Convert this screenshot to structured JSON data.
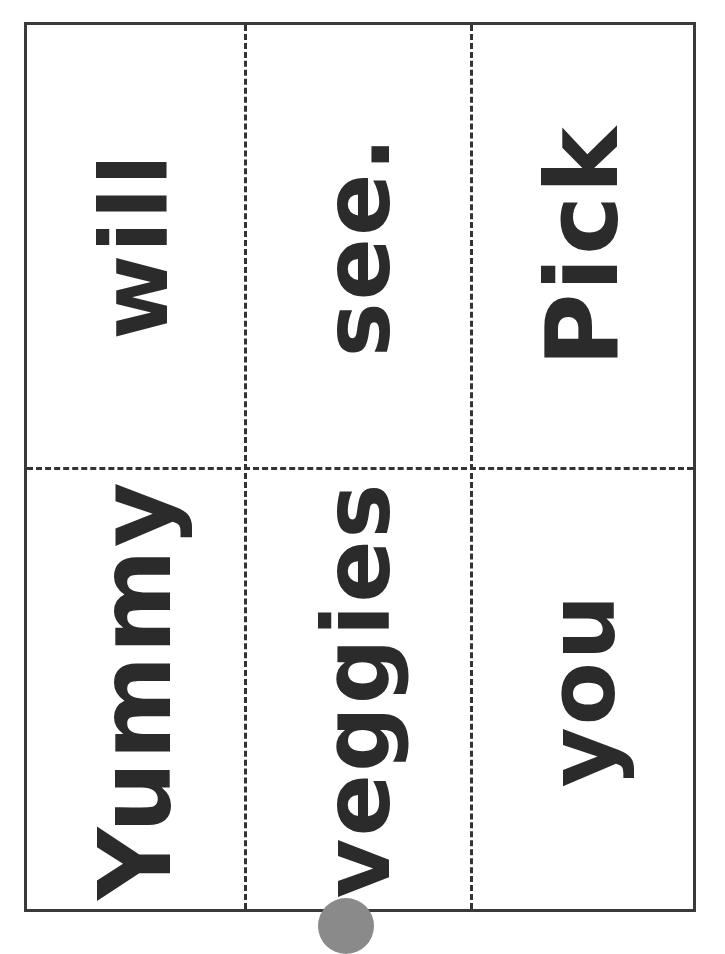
{
  "document": {
    "title": "Sight word cut-apart cards",
    "layout": {
      "rows": 2,
      "columns": 3,
      "text_rotation_deg": -90
    },
    "colors": {
      "text": "#2b2b2b",
      "border": "#3a3a3a",
      "cut_line": "#333333",
      "page_marker": "#8a8a8a"
    },
    "cards": [
      {
        "row": 1,
        "column": 1,
        "word": "will"
      },
      {
        "row": 1,
        "column": 2,
        "word": "see."
      },
      {
        "row": 1,
        "column": 3,
        "word": "Pick"
      },
      {
        "row": 2,
        "column": 1,
        "word": "Yummy"
      },
      {
        "row": 2,
        "column": 2,
        "word": "veggies"
      },
      {
        "row": 2,
        "column": 3,
        "word": "you"
      }
    ]
  }
}
